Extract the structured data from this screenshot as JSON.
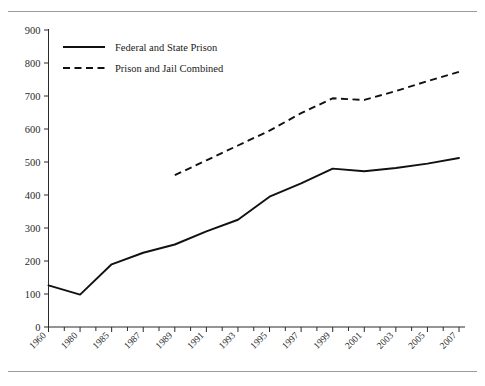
{
  "chart_data": {
    "type": "line",
    "title": "",
    "subtitle": "",
    "xlabel": "",
    "ylabel": "",
    "ylim": [
      0,
      900
    ],
    "ytick_step": 100,
    "yticks": [
      0,
      100,
      200,
      300,
      400,
      500,
      600,
      700,
      800,
      900
    ],
    "grid": false,
    "legend_position": "top-left-inside",
    "categories": [
      1960,
      1980,
      1985,
      1987,
      1989,
      1991,
      1993,
      1995,
      1997,
      1999,
      2001,
      2003,
      2005,
      2007
    ],
    "xtick_labels": [
      "1960",
      "1980",
      "1985",
      "1987",
      "1989",
      "1991",
      "1993",
      "1995",
      "1997",
      "1999",
      "2001",
      "2003",
      "2005",
      "2007"
    ],
    "series": [
      {
        "name": "Federal and State Prison",
        "style": "solid",
        "color": "#111111",
        "x": [
          1960,
          1980,
          1985,
          1987,
          1989,
          1991,
          1993,
          1995,
          1997,
          1999,
          2001,
          2003,
          2005,
          2007
        ],
        "values": [
          126,
          98,
          190,
          225,
          250,
          290,
          325,
          395,
          435,
          480,
          472,
          482,
          495,
          512
        ]
      },
      {
        "name": "Prison and Jail Combined",
        "style": "dashed",
        "color": "#111111",
        "x": [
          1989,
          1991,
          1993,
          1995,
          1997,
          1999,
          2001,
          2003,
          2005,
          2007
        ],
        "values": [
          460,
          505,
          550,
          595,
          648,
          693,
          688,
          715,
          745,
          773
        ]
      }
    ],
    "legend": [
      {
        "label": "Federal and State Prison",
        "style": "solid"
      },
      {
        "label": "Prison and Jail Combined",
        "style": "dashed"
      }
    ]
  }
}
